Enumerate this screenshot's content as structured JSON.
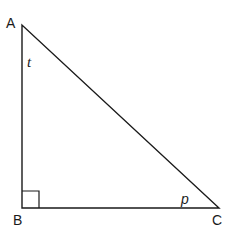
{
  "diagram": {
    "type": "right-triangle",
    "stroke_color": "#1a1a1a",
    "background": "#ffffff",
    "vertices": [
      {
        "id": "A",
        "label": "A",
        "x": 22,
        "y": 25
      },
      {
        "id": "B",
        "label": "B",
        "x": 22,
        "y": 208
      },
      {
        "id": "C",
        "label": "C",
        "x": 219,
        "y": 208
      }
    ],
    "right_angle_at": "B",
    "angle_labels": [
      {
        "at": "A",
        "label": "t"
      },
      {
        "at": "C",
        "label": "p"
      }
    ]
  }
}
